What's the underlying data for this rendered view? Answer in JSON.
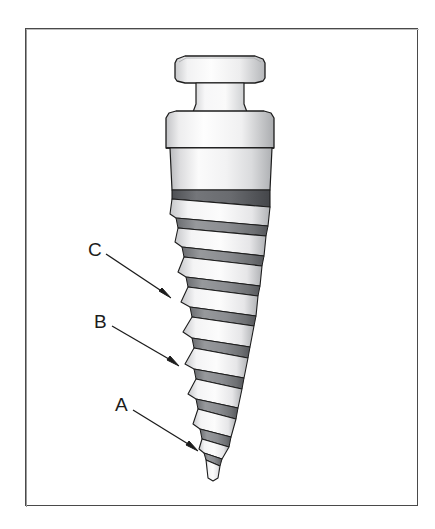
{
  "figure": {
    "kind": "line-art-illustration",
    "background_color": "#ffffff",
    "frame": {
      "border_color": "#4a4a4a",
      "x": 25,
      "y": 28,
      "width": 393,
      "height": 478
    },
    "labels": [
      {
        "id": "label-c",
        "text": "C",
        "x": 88,
        "y": 240,
        "arrow_from": [
          106,
          254
        ],
        "arrow_to": [
          171,
          298
        ]
      },
      {
        "id": "label-b",
        "text": "B",
        "x": 94,
        "y": 312,
        "arrow_from": [
          112,
          326
        ],
        "arrow_to": [
          179,
          366
        ]
      },
      {
        "id": "label-a",
        "text": "A",
        "x": 115,
        "y": 395,
        "arrow_from": [
          133,
          410
        ],
        "arrow_to": [
          198,
          451
        ]
      }
    ],
    "colors": {
      "outline": "#1c1c1c",
      "arrow": "#1c1c1c",
      "highlight": "#fcfcfc",
      "light_gray": "#ececed",
      "mid_gray": "#c4c5c7",
      "dark_gray": "#8e9093",
      "shadow_gray": "#6b6d70",
      "thread_dark": "#53565a"
    },
    "parts": {
      "head_cap": "flat circular top cap",
      "neck": "narrow cylindrical neck",
      "collar": "wide cylindrical collar / abutment platform",
      "smooth_shaft": "unthreaded upper shaft",
      "threaded_body": "tapered helical threaded body",
      "tip": "pointed apical tip"
    }
  }
}
